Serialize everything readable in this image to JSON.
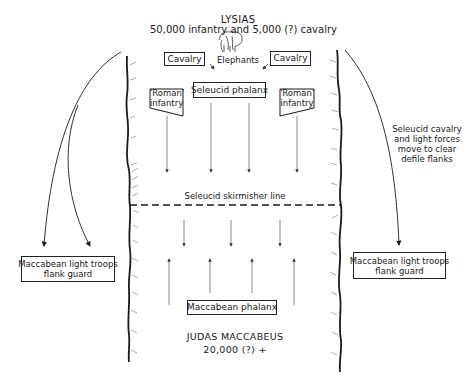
{
  "seleucid": {
    "commander": "LYSIAS",
    "strength": "50,000 infantry and 5,000 (?) cavalry",
    "elephants_label": "Elephants",
    "cavalry_left": "Cavalry",
    "cavalry_right": "Cavalry",
    "phalanx": "Seleucid phalanx",
    "roman_left": [
      "'Roman'",
      "infantry"
    ],
    "roman_right": [
      "'Roman'",
      "infantry"
    ],
    "skirmisher_line": "Seleucid skirmisher line",
    "flank_note": [
      "Seleucid cavalry",
      "and light forces",
      "move to clear",
      "defile flanks"
    ]
  },
  "maccabean": {
    "commander": "JUDAS MACCABEUS",
    "strength": "20,000 (?) +",
    "phalanx": "Maccabean phalanx",
    "flank_guard_left": [
      "Maccabean light troops",
      "flank guard"
    ],
    "flank_guard_right": [
      "Maccabean light troops",
      "flank guard"
    ]
  },
  "icons": {
    "elephant": "elephant-icon"
  },
  "colors": {
    "ink": "#1a1a1a",
    "background": "#ffffff",
    "arrow": "#555555"
  }
}
